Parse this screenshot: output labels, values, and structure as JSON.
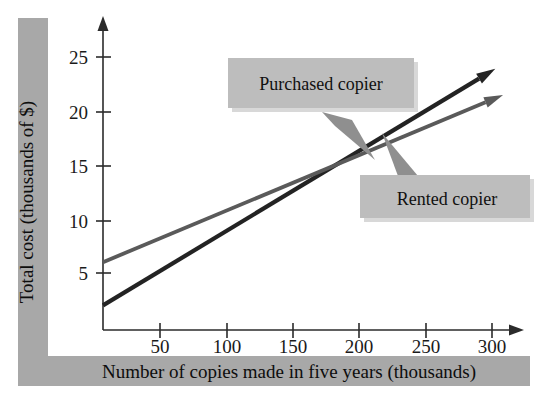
{
  "chart_data": {
    "type": "line",
    "title": "",
    "xlabel": "Number of copies made in five years (thousands)",
    "ylabel": "Total cost (thousands of $)",
    "xlim": [
      0,
      320
    ],
    "ylim": [
      0,
      27
    ],
    "xticks": [
      50,
      100,
      150,
      200,
      250,
      300
    ],
    "xticklabels": [
      "50",
      "100",
      "150",
      "200",
      "250",
      "300"
    ],
    "yticks": [
      5,
      10,
      15,
      20,
      25
    ],
    "yticklabels": [
      "5",
      "10",
      "15",
      "20",
      "25"
    ],
    "grid": false,
    "legend": "annotations",
    "series": [
      {
        "name": "Purchased copier",
        "color": "#232323",
        "x": [
          0,
          290
        ],
        "y": [
          2.0,
          23.0
        ],
        "intercept": 2.0,
        "slope_per_thousand": 0.0724,
        "arrow_end": true
      },
      {
        "name": "Rented copier",
        "color": "#5a5a5a",
        "x": [
          0,
          295
        ],
        "y": [
          6.0,
          20.8
        ],
        "intercept": 6.0,
        "slope_per_thousand": 0.0502,
        "arrow_end": true
      }
    ],
    "intersection": {
      "x": 200,
      "y": 16.5
    },
    "annotations": [
      {
        "label": "Purchased copier",
        "points_to_series": "Purchased copier"
      },
      {
        "label": "Rented copier",
        "points_to_series": "Rented copier"
      }
    ]
  },
  "axes": {
    "y_title": "Total cost (thousands of $)",
    "x_title": "Number of copies made in five years (thousands)",
    "y_tick_labels": [
      "25",
      "20",
      "15",
      "10",
      "5"
    ],
    "x_tick_labels": [
      "50",
      "100",
      "150",
      "200",
      "250",
      "300"
    ]
  },
  "callouts": {
    "purchased": "Purchased copier",
    "rented": "Rented copier"
  },
  "colors": {
    "band": "#a8a8a8",
    "callout_box": "#bdbdbd",
    "purchased_line": "#232323",
    "rented_line": "#5a5a5a",
    "axis": "#2b2b2b",
    "background": "#ffffff"
  }
}
